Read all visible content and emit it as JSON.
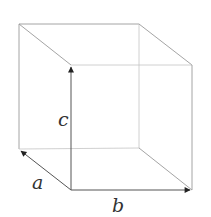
{
  "diagram": {
    "type": "cube-with-vectors",
    "vertices": {
      "back_top_left": [
        19,
        24
      ],
      "back_top_right": [
        139,
        24
      ],
      "back_bottom_left": [
        19,
        149
      ],
      "back_bottom_right": [
        139,
        148
      ],
      "front_top_left": [
        71,
        65
      ],
      "front_top_right": [
        192,
        65
      ],
      "front_bottom_left": [
        71,
        190
      ],
      "front_bottom_right": [
        192,
        190
      ]
    },
    "vectors": [
      {
        "name": "a",
        "from": [
          71,
          190
        ],
        "to": [
          19,
          149
        ]
      },
      {
        "name": "b",
        "from": [
          71,
          190
        ],
        "to": [
          192,
          190
        ]
      },
      {
        "name": "c",
        "from": [
          71,
          190
        ],
        "to": [
          71,
          65
        ]
      }
    ],
    "labels": {
      "a": "a",
      "b": "b",
      "c": "c"
    },
    "colors": {
      "edge": "#9a9a9a",
      "vector": "#555555",
      "label": "#333333"
    }
  }
}
